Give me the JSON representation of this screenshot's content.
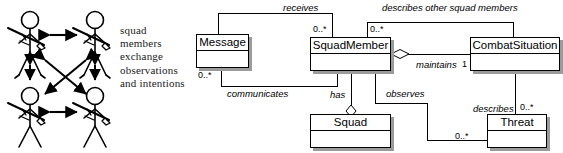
{
  "figure": {
    "left_panel": {
      "caption": "squad members exchange observations and intentions",
      "figure_count": 4,
      "figure_name": "soldier-stick-figure",
      "arrows": [
        {
          "name": "arrow-top-horizontal",
          "style": "double-headed"
        },
        {
          "name": "arrow-bottom-horizontal",
          "style": "double-headed"
        },
        {
          "name": "arrow-left-vertical",
          "style": "double-headed"
        },
        {
          "name": "arrow-right-vertical",
          "style": "double-headed"
        },
        {
          "name": "arrow-diagonal-tl-br",
          "style": "double-headed"
        },
        {
          "name": "arrow-diagonal-tr-bl",
          "style": "double-headed"
        }
      ]
    },
    "uml": {
      "type": "class-diagram",
      "classes": [
        {
          "id": "message",
          "name": "Message",
          "x": 6,
          "y": 34,
          "w": 53,
          "h": 34
        },
        {
          "id": "squadmember",
          "name": "SquadMember",
          "x": 120,
          "y": 37,
          "w": 81,
          "h": 34
        },
        {
          "id": "combatsituation",
          "name": "CombatSituation",
          "x": 280,
          "y": 37,
          "w": 90,
          "h": 34
        },
        {
          "id": "squad",
          "name": "Squad",
          "x": 120,
          "y": 114,
          "w": 81,
          "h": 34
        },
        {
          "id": "threat",
          "name": "Threat",
          "x": 297,
          "y": 114,
          "w": 60,
          "h": 34
        }
      ],
      "associations": [
        {
          "id": "receives",
          "label": "receives",
          "from": "message",
          "to": "squadmember",
          "kind": "association"
        },
        {
          "id": "communicates",
          "label": "communicates",
          "from": "message",
          "to": "squadmember",
          "kind": "association"
        },
        {
          "id": "describes-other",
          "label": "describes other squad members",
          "from": "squadmember",
          "to": "combatsituation",
          "kind": "association"
        },
        {
          "id": "maintains",
          "label": "maintains",
          "from": "squadmember",
          "to": "combatsituation",
          "kind": "aggregation"
        },
        {
          "id": "has",
          "label": "has",
          "from": "squadmember",
          "to": "squad",
          "kind": "aggregation"
        },
        {
          "id": "observes",
          "label": "observes",
          "from": "squadmember",
          "to": "threat",
          "kind": "association"
        },
        {
          "id": "describes",
          "label": "describes",
          "from": "combatsituation",
          "to": "threat",
          "kind": "association"
        }
      ],
      "multiplicities": [
        {
          "id": "m-receives-squadmember",
          "value": "0..*"
        },
        {
          "id": "m-describes-other-squadmember",
          "value": "0..*"
        },
        {
          "id": "m-communicates-message",
          "value": "0..*"
        },
        {
          "id": "m-maintains-combat",
          "value": "1"
        },
        {
          "id": "m-describes-threat",
          "value": "0..*"
        },
        {
          "id": "m-observes-threat",
          "value": "0..*"
        }
      ]
    }
  }
}
